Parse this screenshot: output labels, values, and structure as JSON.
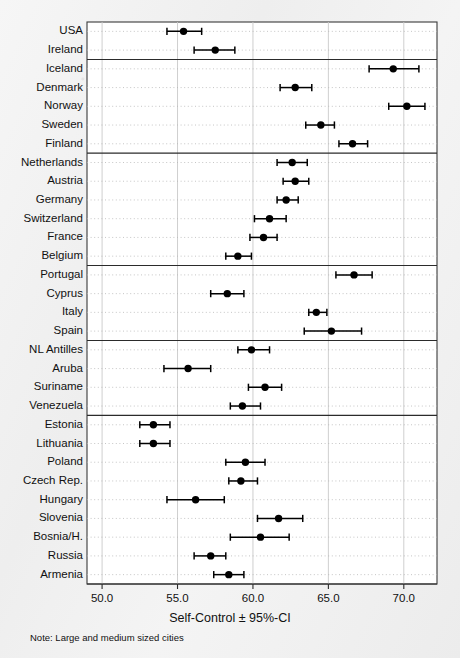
{
  "figure": {
    "note": "Note: Large and medium sized cities",
    "axis_title": "Self-Control ± 95%-CI"
  },
  "chart_data": {
    "type": "scatter",
    "subtype": "forest-plot",
    "title": "",
    "xlabel": "Self-Control ± 95%-CI",
    "ylabel": "",
    "xlim": [
      49.0,
      72.2
    ],
    "xticks": [
      50.0,
      55.0,
      60.0,
      65.0,
      70.0
    ],
    "xticklabels": [
      "50.0",
      "55.0",
      "60.0",
      "65.0",
      "70.0"
    ],
    "grid": "dotted horizontal per-row, solid light vertical at ticks",
    "legend": "none",
    "error_bars": "95% confidence interval, horizontal with end caps",
    "marker": "filled black circle",
    "annotations": [
      "Note: Large and medium sized cities"
    ],
    "group_separators_after": [
      "Ireland",
      "Finland",
      "Belgium",
      "Spain",
      "Venezuela"
    ],
    "categories": [
      "USA",
      "Ireland",
      "Iceland",
      "Denmark",
      "Norway",
      "Sweden",
      "Finland",
      "Netherlands",
      "Austria",
      "Germany",
      "Switzerland",
      "France",
      "Belgium",
      "Portugal",
      "Cyprus",
      "Italy",
      "Spain",
      "NL Antilles",
      "Aruba",
      "Suriname",
      "Venezuela",
      "Estonia",
      "Lithuania",
      "Poland",
      "Czech Rep.",
      "Hungary",
      "Slovenia",
      "Bosnia/H.",
      "Russia",
      "Armenia"
    ],
    "values": [
      55.4,
      57.5,
      69.3,
      62.8,
      70.2,
      64.5,
      66.6,
      62.6,
      62.8,
      62.2,
      61.1,
      60.7,
      59.0,
      66.7,
      58.3,
      64.2,
      65.2,
      59.9,
      55.7,
      60.8,
      59.3,
      53.4,
      53.4,
      59.5,
      59.2,
      56.2,
      61.7,
      60.5,
      57.2,
      58.4
    ],
    "ci_low": [
      54.3,
      56.1,
      67.7,
      61.8,
      69.0,
      63.5,
      65.7,
      61.6,
      62.0,
      61.6,
      60.1,
      59.8,
      58.2,
      65.5,
      57.2,
      63.7,
      63.4,
      59.0,
      54.1,
      59.7,
      58.5,
      52.5,
      52.5,
      58.2,
      58.4,
      54.3,
      60.3,
      58.5,
      56.1,
      57.4
    ],
    "ci_high": [
      56.6,
      58.8,
      71.0,
      63.9,
      71.4,
      65.4,
      67.6,
      63.6,
      63.7,
      63.0,
      62.2,
      61.6,
      59.9,
      67.9,
      59.4,
      64.9,
      67.2,
      61.1,
      57.2,
      61.9,
      60.5,
      54.5,
      54.5,
      60.8,
      60.3,
      58.1,
      63.3,
      62.4,
      58.2,
      59.4
    ]
  }
}
